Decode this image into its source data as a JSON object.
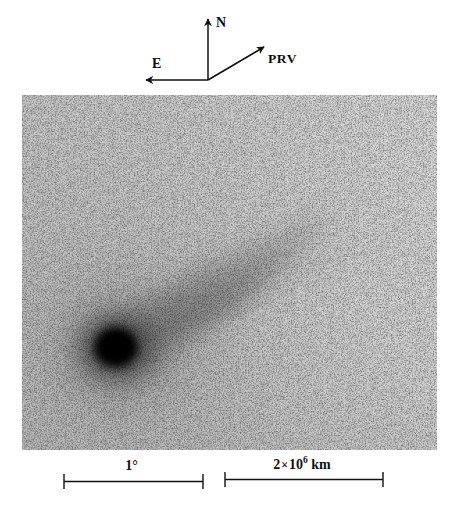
{
  "figure": {
    "kind": "astronomical-photograph"
  },
  "compass": {
    "north": {
      "label": "N",
      "icon": "arrow-up-icon",
      "direction": "up"
    },
    "east": {
      "label": "E",
      "icon": "arrow-left-icon",
      "direction": "left"
    },
    "prv": {
      "label": "PRV",
      "icon": "arrow-upright-icon",
      "direction": "upper-right"
    }
  },
  "plate": {
    "background_color": "#c9c9c9",
    "background_color_right": "#d6d6d6",
    "coma_color": "#111111",
    "tail_color": "#8a8a8a",
    "nucleus": {
      "x": 95,
      "y": 253
    },
    "tail_tip": {
      "x": 310,
      "y": 95
    }
  },
  "scale_bars": [
    {
      "name": "angular-scale",
      "label_text": "1",
      "label_unit": "°",
      "value": 1,
      "unit": "degree"
    },
    {
      "name": "linear-scale",
      "label_mantissa": "2",
      "label_mult": "×",
      "label_base": "10",
      "label_exponent": "6",
      "label_unit": "km",
      "value": 2000000,
      "unit": "km"
    }
  ]
}
